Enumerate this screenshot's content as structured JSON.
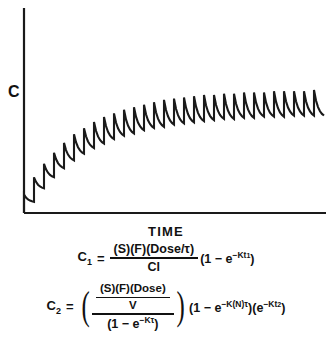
{
  "figure": {
    "y_axis_label": "C",
    "x_axis_label": "TIME"
  },
  "equation1": {
    "lhs": "C",
    "lhs_sub": "1",
    "equals": "=",
    "numerator": "(S)(F)(Dose/τ)",
    "denominator": "Cl",
    "tail_open": "(1 − e",
    "tail_exp": "−Kt",
    "tail_exp_sub": "1",
    "tail_close": ")"
  },
  "equation2": {
    "lhs": "C",
    "lhs_sub": "2",
    "equals": "=",
    "inner_numerator": "(S)(F)(Dose)",
    "inner_denominator": "V",
    "outer_denominator_open": "(1 − e",
    "outer_denominator_exp": "−Kτ",
    "outer_denominator_close": ")",
    "tail1_open": "(1 − e",
    "tail1_exp": "−K(N)τ",
    "tail1_close": ")",
    "tail2_open": "(e",
    "tail2_exp": "−Kt",
    "tail2_exp_sub": "2",
    "tail2_close": ")"
  },
  "chart_data": {
    "type": "line",
    "title": "",
    "xlabel": "TIME",
    "ylabel": "C",
    "grid": false,
    "legend": null,
    "axis_origin_px": [
      24,
      213
    ],
    "x_axis_end_px": [
      326,
      213
    ],
    "y_axis_top_px": [
      24,
      8
    ],
    "n_doses": 30,
    "dose_interval_px": 10,
    "steady_state_peak_y_px": 90,
    "steady_state_trough_y_px": 101,
    "curve_model": "Cpeak(n) = Css_peak * (1 - exp(-n/6.2)); Ctrough(n) = Css_trough * (1 - exp(-n/6.2))",
    "css_peak_value": 1.0,
    "css_trough_value": 0.9,
    "peaks": [
      0.15,
      0.29,
      0.4,
      0.49,
      0.57,
      0.64,
      0.69,
      0.74,
      0.78,
      0.81,
      0.84,
      0.86,
      0.88,
      0.9,
      0.92,
      0.93,
      0.94,
      0.95,
      0.96,
      0.96,
      0.97,
      0.97,
      0.98,
      0.98,
      0.98,
      0.99,
      0.99,
      0.99,
      0.99,
      1.0
    ],
    "troughs": [
      0.1,
      0.22,
      0.32,
      0.4,
      0.47,
      0.53,
      0.58,
      0.62,
      0.66,
      0.69,
      0.71,
      0.74,
      0.76,
      0.77,
      0.79,
      0.8,
      0.81,
      0.82,
      0.83,
      0.84,
      0.84,
      0.85,
      0.85,
      0.86,
      0.86,
      0.86,
      0.87,
      0.87,
      0.87,
      0.87
    ]
  }
}
